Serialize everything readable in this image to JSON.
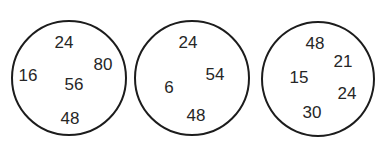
{
  "puzzle": {
    "circles": [
      {
        "id": "circle-1",
        "center": [
          69,
          78
        ],
        "radius": 58,
        "numbers": [
          {
            "value": "24",
            "x": 64,
            "y": 42
          },
          {
            "value": "80",
            "x": 103,
            "y": 64
          },
          {
            "value": "16",
            "x": 28,
            "y": 75
          },
          {
            "value": "56",
            "x": 74,
            "y": 84
          },
          {
            "value": "48",
            "x": 70,
            "y": 118
          }
        ]
      },
      {
        "id": "circle-2",
        "center": [
          192,
          78
        ],
        "radius": 58,
        "numbers": [
          {
            "value": "24",
            "x": 188,
            "y": 42
          },
          {
            "value": "54",
            "x": 215,
            "y": 74
          },
          {
            "value": "6",
            "x": 169,
            "y": 87
          },
          {
            "value": "48",
            "x": 196,
            "y": 115
          }
        ]
      },
      {
        "id": "circle-3",
        "center": [
          318,
          79
        ],
        "radius": 57,
        "numbers": [
          {
            "value": "48",
            "x": 315,
            "y": 43
          },
          {
            "value": "21",
            "x": 343,
            "y": 61
          },
          {
            "value": "15",
            "x": 299,
            "y": 77
          },
          {
            "value": "24",
            "x": 347,
            "y": 93
          },
          {
            "value": "30",
            "x": 312,
            "y": 112
          }
        ]
      }
    ]
  },
  "colors": {
    "background": "#ffffff",
    "stroke": "#1c1c1c",
    "text": "#262626"
  }
}
